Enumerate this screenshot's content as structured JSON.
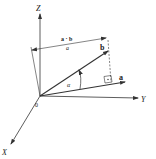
{
  "diagram": {
    "type": "vector-projection",
    "axes": {
      "x_label": "X",
      "y_label": "Y",
      "z_label": "Z",
      "origin_label": "0"
    },
    "vectors": {
      "a_label": "a",
      "b_label": "b"
    },
    "angle_label": "α",
    "projection": {
      "numerator": "a · b",
      "denominator": "a"
    },
    "colors": {
      "line": "#333333",
      "background": "#ffffff"
    }
  }
}
